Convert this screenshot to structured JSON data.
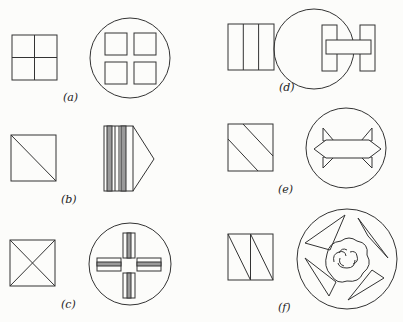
{
  "figure": {
    "panels": [
      {
        "id": "a",
        "label": "(a)",
        "pattern": "square divided into four equal squares",
        "design": "circle containing four separated squares"
      },
      {
        "id": "b",
        "label": "(b)",
        "pattern": "square divided by one diagonal",
        "design": "striped rectangle with triangular point (arrow)"
      },
      {
        "id": "c",
        "label": "(c)",
        "pattern": "square divided by both diagonals",
        "design": "circle containing four striped bars forming a cross"
      },
      {
        "id": "d",
        "label": "(d)",
        "pattern": "square divided into three vertical strips",
        "design": "circle containing an H shape"
      },
      {
        "id": "e",
        "label": "(e)",
        "pattern": "square with two parallel diagonal cuts",
        "design": "circle containing double-headed arrow with triangular fins"
      },
      {
        "id": "f",
        "label": "(f)",
        "pattern": "two rectangles each divided by a diagonal",
        "design": "circle with four triangles around a central rose"
      }
    ],
    "colors": {
      "line": "#333333",
      "shade": "#9a9a9a",
      "background": "#fcfcfa"
    }
  }
}
